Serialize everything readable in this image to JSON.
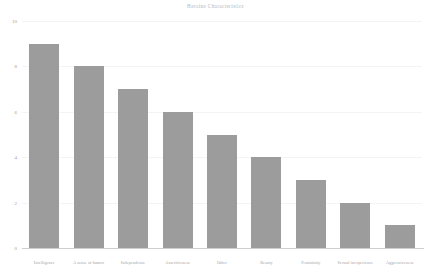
{
  "chart_data": {
    "type": "bar",
    "title": "Heroine Characteristics",
    "xlabel": "",
    "ylabel": "",
    "ylim": [
      0,
      10
    ],
    "yticks": [
      0,
      2,
      4,
      6,
      8,
      10
    ],
    "grid": true,
    "legend": "none",
    "bar_color": "#9c9c9c",
    "categories": [
      "Intelligence",
      "A sense of humor",
      "Independence",
      "Assertiveness",
      "Other",
      "Beauty",
      "Femininity",
      "Sexual inexperience",
      "Aggressiveness"
    ],
    "values": [
      9,
      8,
      7,
      6,
      5,
      4,
      3,
      2,
      1
    ]
  }
}
